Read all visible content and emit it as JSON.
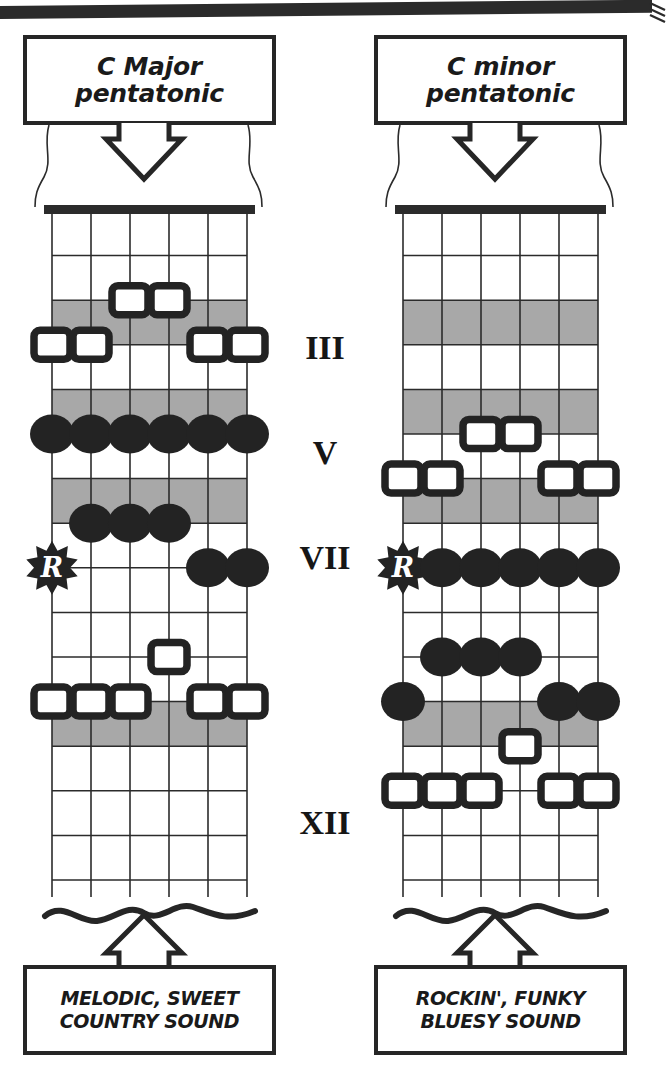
{
  "meta": {
    "colors": {
      "ink": "#1a1a1a",
      "line": "#2b2b2b",
      "shade": "#a8a8a8",
      "paper": "#ffffff",
      "dot_fill": "#232323"
    }
  },
  "top_rule": {
    "icon": "horizontal-rule"
  },
  "diagrams": [
    {
      "id": "c-major-pentatonic",
      "title": "C Major\npentatonic",
      "caption": "MELODIC, SWEET\nCOUNTRY SOUND",
      "root_badge": "R",
      "strings": 6,
      "frets": 15,
      "shaded_frets": [
        3,
        5,
        7,
        12
      ],
      "markers": [
        {
          "string": 3,
          "fret": 2,
          "type": "square"
        },
        {
          "string": 4,
          "fret": 2,
          "type": "square"
        },
        {
          "string": 1,
          "fret": 3,
          "type": "square"
        },
        {
          "string": 2,
          "fret": 3,
          "type": "square"
        },
        {
          "string": 5,
          "fret": 3,
          "type": "square"
        },
        {
          "string": 6,
          "fret": 3,
          "type": "square"
        },
        {
          "string": 1,
          "fret": 5,
          "type": "dot"
        },
        {
          "string": 2,
          "fret": 5,
          "type": "dot"
        },
        {
          "string": 3,
          "fret": 5,
          "type": "dot"
        },
        {
          "string": 4,
          "fret": 5,
          "type": "dot"
        },
        {
          "string": 5,
          "fret": 5,
          "type": "dot"
        },
        {
          "string": 6,
          "fret": 5,
          "type": "dot"
        },
        {
          "string": 2,
          "fret": 7,
          "type": "dot"
        },
        {
          "string": 3,
          "fret": 7,
          "type": "dot"
        },
        {
          "string": 4,
          "fret": 7,
          "type": "dot"
        },
        {
          "string": 1,
          "fret": 8,
          "type": "root"
        },
        {
          "string": 5,
          "fret": 8,
          "type": "dot"
        },
        {
          "string": 6,
          "fret": 8,
          "type": "dot"
        },
        {
          "string": 4,
          "fret": 10,
          "type": "square"
        },
        {
          "string": 1,
          "fret": 11,
          "type": "square"
        },
        {
          "string": 2,
          "fret": 11,
          "type": "square"
        },
        {
          "string": 3,
          "fret": 11,
          "type": "square"
        },
        {
          "string": 5,
          "fret": 11,
          "type": "square"
        },
        {
          "string": 6,
          "fret": 11,
          "type": "square"
        }
      ]
    },
    {
      "id": "c-minor-pentatonic",
      "title": "C minor\npentatonic",
      "caption": "ROCKIN', FUNKY\nBLUESY SOUND",
      "root_badge": "R",
      "strings": 6,
      "frets": 15,
      "shaded_frets": [
        3,
        5,
        7,
        12
      ],
      "markers": [
        {
          "string": 3,
          "fret": 5,
          "type": "square"
        },
        {
          "string": 4,
          "fret": 5,
          "type": "square"
        },
        {
          "string": 1,
          "fret": 6,
          "type": "square"
        },
        {
          "string": 2,
          "fret": 6,
          "type": "square"
        },
        {
          "string": 5,
          "fret": 6,
          "type": "square"
        },
        {
          "string": 6,
          "fret": 6,
          "type": "square"
        },
        {
          "string": 1,
          "fret": 8,
          "type": "root"
        },
        {
          "string": 2,
          "fret": 8,
          "type": "dot"
        },
        {
          "string": 3,
          "fret": 8,
          "type": "dot"
        },
        {
          "string": 4,
          "fret": 8,
          "type": "dot"
        },
        {
          "string": 5,
          "fret": 8,
          "type": "dot"
        },
        {
          "string": 6,
          "fret": 8,
          "type": "dot"
        },
        {
          "string": 2,
          "fret": 10,
          "type": "dot"
        },
        {
          "string": 3,
          "fret": 10,
          "type": "dot"
        },
        {
          "string": 4,
          "fret": 10,
          "type": "dot"
        },
        {
          "string": 1,
          "fret": 11,
          "type": "dot"
        },
        {
          "string": 5,
          "fret": 11,
          "type": "dot"
        },
        {
          "string": 6,
          "fret": 11,
          "type": "dot"
        },
        {
          "string": 4,
          "fret": 12,
          "type": "square"
        },
        {
          "string": 1,
          "fret": 13,
          "type": "square"
        },
        {
          "string": 2,
          "fret": 13,
          "type": "square"
        },
        {
          "string": 3,
          "fret": 13,
          "type": "square"
        },
        {
          "string": 5,
          "fret": 13,
          "type": "square"
        },
        {
          "string": 6,
          "fret": 13,
          "type": "square"
        }
      ]
    }
  ],
  "fret_markers": [
    {
      "label": "III",
      "fret": 3
    },
    {
      "label": "V",
      "fret": 5
    },
    {
      "label": "VII",
      "fret": 7
    },
    {
      "label": "XII",
      "fret": 12
    }
  ]
}
